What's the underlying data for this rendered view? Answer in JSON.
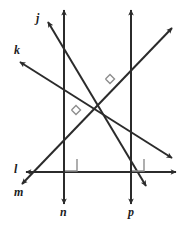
{
  "diagram": {
    "type": "geometry-line-diagram",
    "canvas": {
      "width": 181,
      "height": 230
    },
    "style": {
      "background": "#ffffff",
      "line_color": "#2b2b2b",
      "line_width": 2,
      "angle_mark_color": "#8d8d8d",
      "angle_mark_width": 1.4,
      "label_color": "#1c1c1c",
      "label_font_size": 12
    },
    "lines": [
      {
        "id": "j",
        "label": "j",
        "orientation": "diagonal-descending",
        "x1": 48,
        "y1": 22,
        "x2": 146,
        "y2": 186,
        "arrow_start": true,
        "arrow_end": true
      },
      {
        "id": "k",
        "label": "k",
        "orientation": "diagonal-descending",
        "x1": 20,
        "y1": 62,
        "x2": 172,
        "y2": 158,
        "arrow_start": true,
        "arrow_end": true
      },
      {
        "id": "m",
        "label": "m",
        "orientation": "diagonal-ascending",
        "x1": 22,
        "y1": 184,
        "x2": 172,
        "y2": 28,
        "arrow_start": true,
        "arrow_end": true
      },
      {
        "id": "l",
        "label": "l",
        "orientation": "horizontal",
        "x1": 26,
        "y1": 172,
        "x2": 176,
        "y2": 172,
        "arrow_start": true,
        "arrow_end": true
      },
      {
        "id": "n",
        "label": "n",
        "orientation": "vertical",
        "x1": 64,
        "y1": 10,
        "x2": 64,
        "y2": 204,
        "arrow_start": true,
        "arrow_end": true
      },
      {
        "id": "p",
        "label": "p",
        "orientation": "vertical",
        "x1": 131,
        "y1": 10,
        "x2": 131,
        "y2": 204,
        "arrow_start": true,
        "arrow_end": true
      }
    ],
    "labels": [
      {
        "id": "label-j",
        "text": "j",
        "x": 36,
        "y": 12
      },
      {
        "id": "label-k",
        "text": "k",
        "x": 14,
        "y": 44
      },
      {
        "id": "label-l",
        "text": "l",
        "x": 14,
        "y": 163
      },
      {
        "id": "label-m",
        "text": "m",
        "x": 14,
        "y": 186
      },
      {
        "id": "label-n",
        "text": "n",
        "x": 60,
        "y": 206
      },
      {
        "id": "label-p",
        "text": "p",
        "x": 128,
        "y": 206
      }
    ],
    "right_angle_marks": [
      {
        "id": "angle-j-m",
        "at_lines": "j and m",
        "style": "rotated-square",
        "cx": 110,
        "cy": 79,
        "size": 9
      },
      {
        "id": "angle-k-m",
        "at_lines": "k and m",
        "style": "rotated-square",
        "cx": 76,
        "cy": 110,
        "size": 9
      },
      {
        "id": "angle-n-l",
        "at_lines": "n and l",
        "style": "square",
        "x": 65,
        "y": 159,
        "size": 12
      },
      {
        "id": "angle-p-l",
        "at_lines": "p and l",
        "style": "square",
        "x": 132,
        "y": 159,
        "size": 12
      }
    ]
  }
}
